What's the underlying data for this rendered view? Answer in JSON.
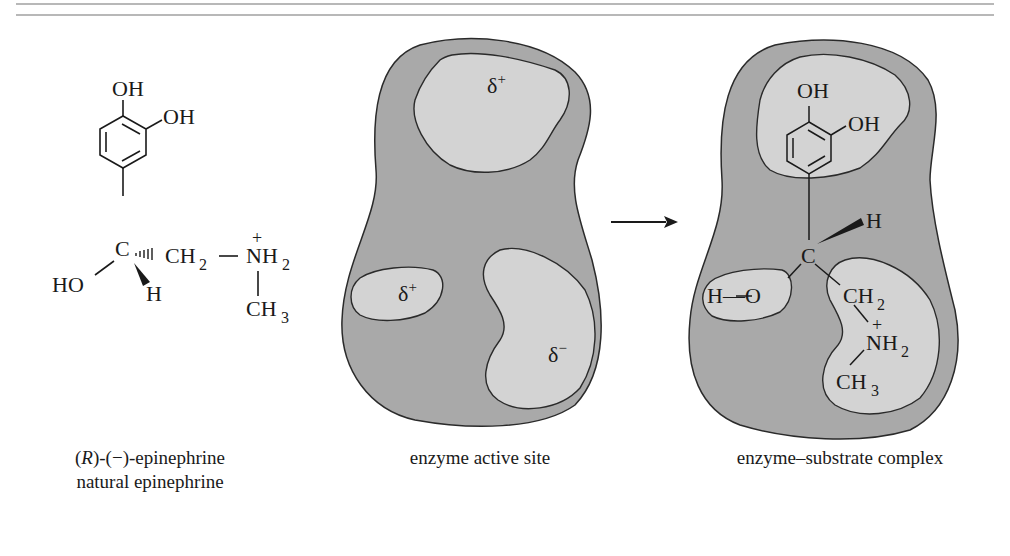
{
  "figure": {
    "panels": [
      {
        "id": "epinephrine",
        "caption_line1_prefix": "(",
        "caption_line1_italic": "R",
        "caption_line1_suffix": ")-(−)-epinephrine",
        "caption_line2": "natural epinephrine",
        "atoms": {
          "oh_top": "OH",
          "oh_side": "OH",
          "c": "C",
          "ch2": "CH",
          "ch2_sub": "2",
          "bond_dash": "—",
          "nh2": "NH",
          "nh2_sub": "2",
          "plus": "+",
          "ho": "HO",
          "h": "H",
          "ch3": "CH",
          "ch3_sub": "3"
        }
      },
      {
        "id": "active-site",
        "caption": "enzyme active site",
        "pockets": [
          {
            "label": "δ",
            "charge": "+"
          },
          {
            "label": "δ",
            "charge": "+"
          },
          {
            "label": "δ",
            "charge": "−"
          }
        ]
      },
      {
        "id": "complex",
        "caption": "enzyme–substrate complex",
        "atoms": {
          "oh_top": "OH",
          "oh_side": "OH",
          "h": "H",
          "c": "C",
          "h_o": "H—O",
          "ch2": "CH",
          "ch2_sub": "2",
          "plus": "+",
          "nh2": "NH",
          "nh2_sub": "2",
          "ch3": "CH",
          "ch3_sub": "3"
        }
      }
    ],
    "colors": {
      "enzyme_fill": "#a9a9a9",
      "pocket_fill": "#d3d3d3",
      "outline": "#2a2a2a",
      "rule": "#b8b8b8"
    }
  }
}
